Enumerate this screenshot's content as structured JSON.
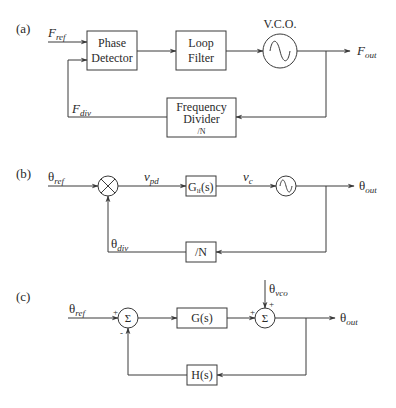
{
  "panels": [
    {
      "id": "a",
      "label": "(a)",
      "input_signal": {
        "main": "F",
        "sub": "ref"
      },
      "feedback_signal": {
        "main": "F",
        "sub": "div"
      },
      "output_signal": {
        "main": "F",
        "sub": "out"
      },
      "blocks": {
        "phase_detector": {
          "line1": "Phase",
          "line2": "Detector"
        },
        "loop_filter": {
          "line1": "Loop",
          "line2": "Filter"
        },
        "vco": {
          "label": "V.C.O.",
          "symbol": "~"
        },
        "frequency_divider": {
          "line1": "Frequency",
          "line2": "Divider",
          "line3": "/N"
        }
      }
    },
    {
      "id": "b",
      "label": "(b)",
      "input_signal": {
        "main": "θ",
        "sub": "ref"
      },
      "feedback_signal": {
        "main": "θ",
        "sub": "div"
      },
      "output_signal": {
        "main": "θ",
        "sub": "out"
      },
      "pd_output": {
        "main": "v",
        "sub": "pd"
      },
      "control_voltage": {
        "main": "v",
        "sub": "c"
      },
      "blocks": {
        "multiplier": {
          "symbol": "×"
        },
        "loop_filter": {
          "main": "G",
          "sub": "lf",
          "tail": "(s)"
        },
        "vco": {
          "symbol": "~"
        },
        "divider": {
          "label": "/N"
        }
      }
    },
    {
      "id": "c",
      "label": "(c)",
      "input_signal": {
        "main": "θ",
        "sub": "ref"
      },
      "disturbance_signal": {
        "main": "θ",
        "sub": "vco"
      },
      "output_signal": {
        "main": "θ",
        "sub": "out"
      },
      "blocks": {
        "sum1": {
          "symbol": "Σ",
          "sign_in": "+",
          "sign_fb": "-"
        },
        "forward": {
          "label": "G(s)"
        },
        "sum2": {
          "symbol": "Σ",
          "sign_in": "+",
          "sign_dist": "+"
        },
        "feedback": {
          "label": "H(s)"
        }
      }
    }
  ],
  "colors": {
    "line": "#3a3a3a",
    "text": "#2a2a2a",
    "background": "#ffffff"
  }
}
